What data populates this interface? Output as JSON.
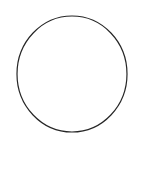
{
  "canvas": {
    "width": 145,
    "height": 185,
    "background_color": "#ffffff",
    "label": "figure-canvas"
  },
  "figure": {
    "type": "geometric-shape",
    "shape_name": "circle",
    "stroke_color": "#262626",
    "fill_color": "none",
    "stroke_width": 1.2,
    "center_x": 72,
    "center_y": 74,
    "radius_x": 55,
    "radius_y": 58,
    "bounds": {
      "left": 17,
      "top": 16,
      "right": 127,
      "bottom": 132,
      "width": 110,
      "height": 116
    }
  },
  "annotations": {
    "labels": [],
    "caption": ""
  }
}
